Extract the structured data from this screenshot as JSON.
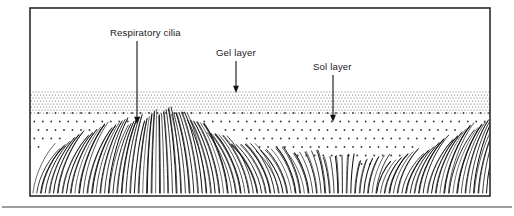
{
  "figure": {
    "frame": {
      "x": 30,
      "y": 8,
      "width": 460,
      "height": 188,
      "border_color": "#2b2b2b",
      "background_color": "#ffffff"
    },
    "baseline_rule": {
      "y": 207,
      "x_start": 2,
      "x_end": 512,
      "color": "#3a3a3a"
    }
  },
  "layers": [
    {
      "id": "gel-layer",
      "name": "Gel layer",
      "top": 92,
      "bottom": 113,
      "pattern": "dense-fine-dots",
      "dot_color": "#6e6e6e",
      "dot_spacing": 3.0,
      "dot_radius": 0.62
    },
    {
      "id": "sol-layer",
      "name": "Sol layer",
      "top": 113,
      "bottom": 178,
      "pattern": "sparse-coarse-dots",
      "dot_color": "#3c3c3c",
      "dot_spacing": 8.5,
      "dot_radius": 0.95
    }
  ],
  "labels": [
    {
      "id": "respiratory-cilia",
      "text": "Respiratory cilia",
      "text_x": 110,
      "text_y": 36,
      "anchor": "start",
      "arrow": {
        "x": 137,
        "y_start": 41,
        "y_end": 124
      }
    },
    {
      "id": "gel-layer",
      "text": "Gel layer",
      "text_x": 216,
      "text_y": 56,
      "anchor": "start",
      "arrow": {
        "x": 236,
        "y_start": 61,
        "y_end": 93
      }
    },
    {
      "id": "sol-layer",
      "text": "Sol layer",
      "text_x": 313,
      "text_y": 70,
      "anchor": "start",
      "arrow": {
        "x": 333,
        "y_start": 75,
        "y_end": 122
      }
    }
  ],
  "cilia": {
    "description": "Field of respiratory cilia beating in a metachronal wave; erect cilia at wave crests, recovery-stroke bent cilia in troughs.",
    "stroke_color": "#111111",
    "count": 168,
    "field_x_start": 33,
    "field_x_end": 487,
    "base_y": 193,
    "wave": {
      "crest_positions": [
        140,
        330,
        470
      ],
      "trough_positions": [
        60,
        240,
        400
      ],
      "tip_y_crest": 112,
      "tip_y_trough": 158,
      "bend_strength": 26
    }
  },
  "chart_data": {
    "type": "diagram",
    "annotations": [
      "Respiratory cilia",
      "Gel layer",
      "Sol layer"
    ]
  }
}
